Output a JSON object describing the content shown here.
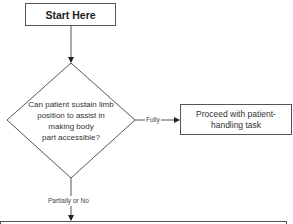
{
  "diagram": {
    "type": "flowchart",
    "nodes": {
      "start": {
        "label": "Start Here",
        "shape": "rectangle"
      },
      "decision": {
        "label": "Can patient sustain limb\nposition to assist in\nmaking body\npart accessible?",
        "shape": "diamond"
      },
      "proceed": {
        "label": "Proceed with patient-handling task",
        "shape": "rectangle"
      },
      "next": {
        "label": "",
        "shape": "rectangle"
      }
    },
    "edges": {
      "start_to_decision": {
        "label": ""
      },
      "decision_to_proceed": {
        "label": "Fully"
      },
      "decision_to_next": {
        "label": "Partially or No"
      }
    },
    "colors": {
      "stroke": "#555555",
      "text": "#333333",
      "background": "#ffffff"
    }
  }
}
